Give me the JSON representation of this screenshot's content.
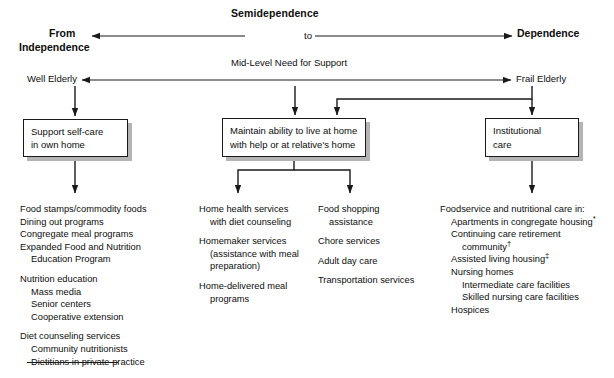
{
  "diagram": {
    "title": "Semidependence",
    "continuum": {
      "left_label_line1": "From",
      "left_label_line2": "Independence",
      "middle_label": "to",
      "right_label": "Dependence"
    },
    "support_axis": {
      "label": "Mid-Level Need for Support",
      "left_label": "Well Elderly",
      "right_label": "Frail Elderly"
    },
    "boxes": {
      "self_care": {
        "line1": "Support self-care",
        "line2": "in own home"
      },
      "maintain_home": {
        "line1": "Maintain ability to live at home",
        "line2": "with help or at relative's home"
      },
      "institutional": {
        "line1": "Institutional",
        "line2": "care"
      }
    },
    "columns": {
      "well_elderly_services": [
        {
          "text": "Food stamps/commodity foods",
          "indent": 0
        },
        {
          "text": "Dining out programs",
          "indent": 0
        },
        {
          "text": "Congregate meal programs",
          "indent": 0
        },
        {
          "text": "Expanded Food and Nutrition",
          "indent": 0
        },
        {
          "text": "Education Program",
          "indent": 1
        },
        {
          "text": "",
          "indent": 0,
          "spacer": true
        },
        {
          "text": "Nutrition education",
          "indent": 0
        },
        {
          "text": "Mass media",
          "indent": 1
        },
        {
          "text": "Senior centers",
          "indent": 1
        },
        {
          "text": "Cooperative extension",
          "indent": 1
        },
        {
          "text": "",
          "indent": 0,
          "spacer": true
        },
        {
          "text": "Diet counseling services",
          "indent": 0
        },
        {
          "text": "Community nutritionists",
          "indent": 1
        },
        {
          "text": "Dietitians in private practice",
          "indent": 1
        }
      ],
      "home_services": [
        {
          "text": "Home health services",
          "indent": 0
        },
        {
          "text": "with diet counseling",
          "indent": 1
        },
        {
          "text": "",
          "indent": 0,
          "spacer": true
        },
        {
          "text": "Homemaker services",
          "indent": 0
        },
        {
          "text": "(assistance with meal",
          "indent": 1
        },
        {
          "text": "preparation)",
          "indent": 1
        },
        {
          "text": "",
          "indent": 0,
          "spacer": true
        },
        {
          "text": "Home-delivered meal",
          "indent": 0
        },
        {
          "text": "programs",
          "indent": 1
        }
      ],
      "support_services": [
        {
          "text": "Food shopping",
          "indent": 0
        },
        {
          "text": "assistance",
          "indent": 1
        },
        {
          "text": "",
          "indent": 0,
          "spacer": true
        },
        {
          "text": "Chore services",
          "indent": 0
        },
        {
          "text": "",
          "indent": 0,
          "spacer": true
        },
        {
          "text": "Adult day care",
          "indent": 0
        },
        {
          "text": "",
          "indent": 0,
          "spacer": true
        },
        {
          "text": "Transportation services",
          "indent": 0
        }
      ],
      "institutional_services": [
        {
          "text": "Foodservice and nutritional care in:",
          "indent": 0
        },
        {
          "text": "Apartments in congregate housing",
          "indent": 1,
          "footnote": "*"
        },
        {
          "text": "Continuing care retirement",
          "indent": 1
        },
        {
          "text": "community",
          "indent": 2,
          "footnote": "†"
        },
        {
          "text": "Assisted living housing",
          "indent": 1,
          "footnote": "‡"
        },
        {
          "text": "Nursing homes",
          "indent": 1
        },
        {
          "text": "Intermediate care facilities",
          "indent": 2
        },
        {
          "text": "Skilled nursing care facilities",
          "indent": 2
        },
        {
          "text": "Hospices",
          "indent": 1
        }
      ]
    },
    "colors": {
      "ink": "#0d0d0d",
      "line": "#1a1a1a",
      "shadow": "#b4b4b4",
      "background": "#ffffff"
    }
  }
}
